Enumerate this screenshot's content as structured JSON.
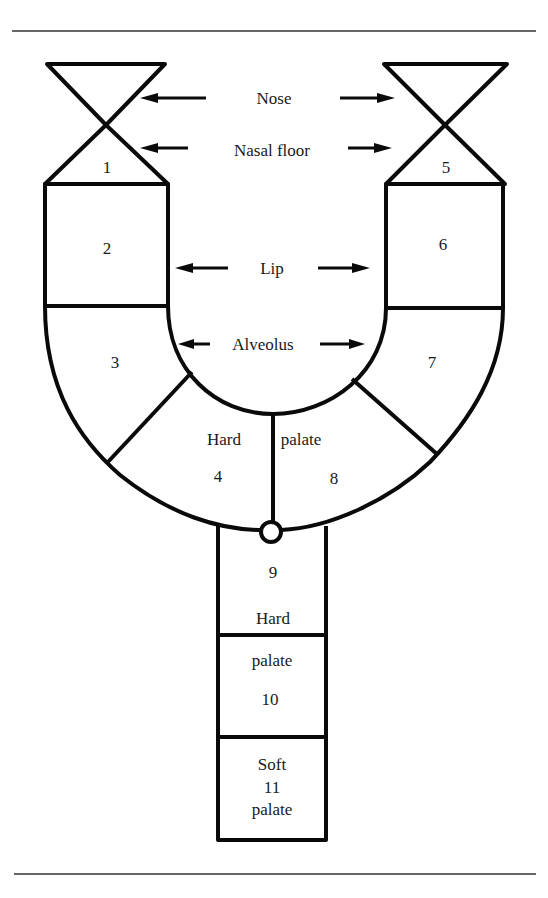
{
  "diagram": {
    "labels": {
      "nose": "Nose",
      "nasal_floor": "Nasal floor",
      "lip": "Lip",
      "alveolus": "Alveolus",
      "hard_palate_left": "Hard",
      "hard_palate_right": "palate",
      "hard_lower": "Hard",
      "palate_lower": "palate",
      "soft": "Soft",
      "soft_palate": "palate"
    },
    "segments": [
      {
        "id": "1",
        "region": "left nose / nasal floor"
      },
      {
        "id": "2",
        "region": "left lip"
      },
      {
        "id": "3",
        "region": "left alveolus"
      },
      {
        "id": "4",
        "region": "left hard palate"
      },
      {
        "id": "5",
        "region": "right nose / nasal floor"
      },
      {
        "id": "6",
        "region": "right lip"
      },
      {
        "id": "7",
        "region": "right alveolus"
      },
      {
        "id": "8",
        "region": "right hard palate"
      },
      {
        "id": "9",
        "region": "hard palate"
      },
      {
        "id": "10",
        "region": "hard palate"
      },
      {
        "id": "11",
        "region": "soft palate"
      }
    ]
  }
}
